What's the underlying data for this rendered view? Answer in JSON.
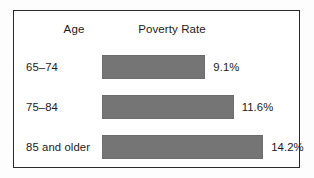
{
  "chart_data": {
    "type": "bar",
    "orientation": "horizontal",
    "title": "",
    "categories": [
      "65–74",
      "75–84",
      "85 and older"
    ],
    "values": [
      9.1,
      11.6,
      14.2
    ],
    "value_labels": [
      "9.1%",
      "11.6%",
      "14.2%"
    ],
    "category_header": "Age",
    "value_header": "Poverty Rate",
    "xlabel": "",
    "ylabel": "",
    "xlim": [
      0,
      17.0
    ],
    "grid": false,
    "legend": false,
    "units": "percent",
    "bar_color": "#757575",
    "series": [
      {
        "name": "Poverty Rate",
        "values": [
          9.1,
          11.6,
          14.2
        ]
      }
    ]
  },
  "figure": {
    "border_color": "#2b2b2b",
    "background_color": "#ffffff",
    "text_color": "#1b1b1b"
  },
  "headers": {
    "age": "Age",
    "rate": "Poverty Rate"
  },
  "rows": [
    {
      "label": "65–74",
      "value": 9.1,
      "value_label": "9.1%"
    },
    {
      "label": "75–84",
      "value": 11.6,
      "value_label": "11.6%"
    },
    {
      "label": "85 and older",
      "value": 14.2,
      "value_label": "14.2%"
    }
  ]
}
